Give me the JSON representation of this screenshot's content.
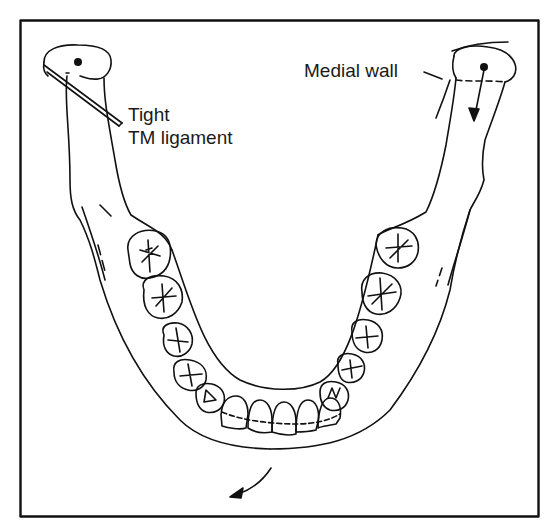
{
  "figure": {
    "colors": {
      "line": "#111111",
      "background": "#ffffff"
    }
  },
  "labels": {
    "tight": "Tight",
    "tm_ligament": "TM ligament",
    "medial_wall": "Medial wall"
  },
  "annotations": {
    "left_condyle_marker": "rotation-center-dot",
    "right_condyle_marker": "rotation-center-dot",
    "right_condyle_arrow": "downward-translation-arrow",
    "chin_arrow": "mandible-shift-arrow"
  }
}
